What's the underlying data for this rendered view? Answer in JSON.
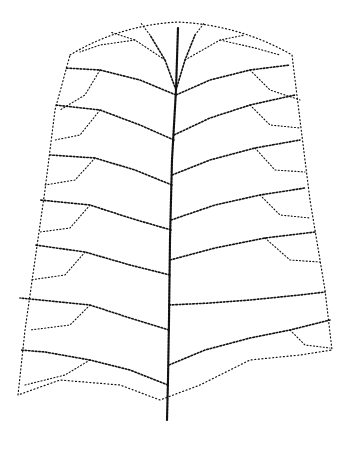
{
  "image": {
    "subject": "leaf venation network",
    "style": "stippled dotted line drawing",
    "colors": {
      "background": "#ffffff",
      "ink": "#111111"
    },
    "width": 353,
    "height": 452
  }
}
